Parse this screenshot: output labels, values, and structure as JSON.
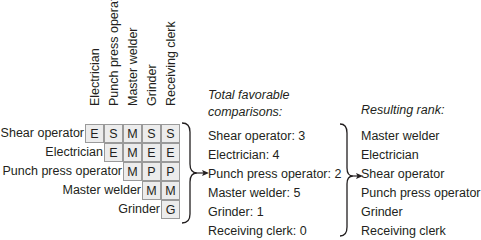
{
  "matrix": {
    "column_headers": [
      "Electrician",
      "Punch press operator",
      "Master welder",
      "Grinder",
      "Receiving clerk"
    ],
    "rows": [
      {
        "label": "Shear operator",
        "cells": [
          "E",
          "S",
          "M",
          "S",
          "S"
        ]
      },
      {
        "label": "Electrician",
        "cells": [
          "E",
          "M",
          "E",
          "E"
        ]
      },
      {
        "label": "Punch press operator",
        "cells": [
          "M",
          "P",
          "P"
        ]
      },
      {
        "label": "Master welder",
        "cells": [
          "M",
          "M"
        ]
      },
      {
        "label": "Grinder",
        "cells": [
          "G"
        ]
      }
    ]
  },
  "favorable": {
    "heading_line1": "Total favorable",
    "heading_line2": "comparisons:",
    "items": [
      "Shear operator:  3",
      "Electrician:  4",
      "Punch press operator:  2",
      "Master welder:  5",
      "Grinder:  1",
      "Receiving clerk:  0"
    ]
  },
  "rank": {
    "heading": "Resulting rank:",
    "items": [
      "Master welder",
      "Electrician",
      "Shear operator",
      "Punch press operator",
      "Grinder",
      "Receiving clerk"
    ]
  },
  "colors": {
    "cell_fill": "#ececec",
    "cell_border": "#9a9a9a",
    "text": "#231f20"
  }
}
